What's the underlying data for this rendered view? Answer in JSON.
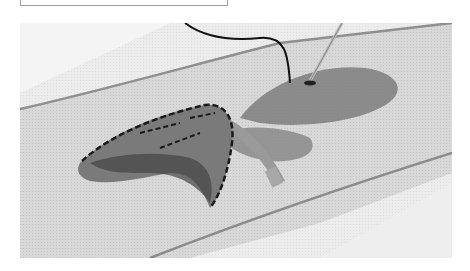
{
  "caption": {
    "text": ""
  },
  "photo": {
    "subject": "Butterfly embroidered on mesh ribbon with needle and thread",
    "colors": {
      "background": "#f2f2f2",
      "fabric": "#d6d6d6",
      "fabric_edge": "#8f8f8f",
      "wing_fill": "#8a8a8a",
      "wing_dark": "#555555",
      "stitch": "#1a1a1a",
      "thread": "#111111",
      "needle": "#bdbdbd"
    }
  }
}
